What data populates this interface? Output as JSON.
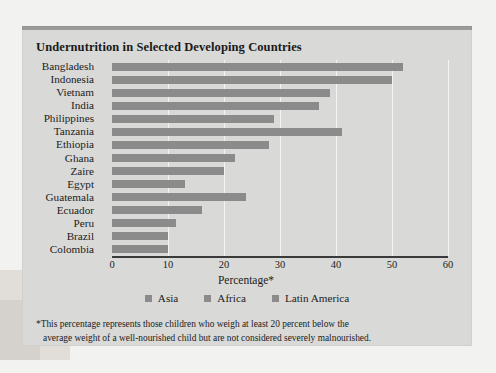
{
  "chart_data": {
    "type": "bar",
    "orientation": "horizontal",
    "title": "Undernutrition in Selected Developing Countries",
    "xlabel": "Percentage*",
    "ylabel": "",
    "xlim": [
      0,
      60
    ],
    "xticks": [
      0,
      10,
      20,
      30,
      40,
      50,
      60
    ],
    "xtick_labels": [
      "0",
      "10",
      "20",
      "30",
      "40",
      "50",
      "60"
    ],
    "grid": "vertical",
    "legend_position": "bottom-center",
    "categories": [
      "Bangladesh",
      "Indonesia",
      "Vietnam",
      "India",
      "Philippines",
      "Tanzania",
      "Ethiopia",
      "Ghana",
      "Zaire",
      "Egypt",
      "Guatemala",
      "Ecuador",
      "Peru",
      "Brazil",
      "Colombia"
    ],
    "values": [
      52,
      50,
      39,
      37,
      29,
      41,
      28,
      22,
      20,
      13,
      24,
      16,
      11.5,
      10,
      10
    ],
    "groups": [
      "Asia",
      "Asia",
      "Asia",
      "Asia",
      "Asia",
      "Africa",
      "Africa",
      "Africa",
      "Africa",
      "Africa",
      "Latin America",
      "Latin America",
      "Latin America",
      "Latin America",
      "Latin America"
    ],
    "legend": [
      "Asia",
      "Africa",
      "Latin America"
    ],
    "bar_color": "#8b8b8b",
    "panel_color": "#d9d9d7",
    "annotations": [
      "*This percentage represents those children who weigh at least 20 percent below the average weight of a well-nourished child but are not considered severely malnourished."
    ]
  },
  "footnote": {
    "line1": "*This percentage represents those children who weigh at least 20 percent below the",
    "line2": "average weight of a well-nourished child but are not considered severely malnourished."
  },
  "colors": {
    "bar": "#8b8b8b",
    "panel": "#d9d9d7",
    "page": "#f2f2f0",
    "text": "#1c1c1c",
    "gridline": "#f4f4f2",
    "axis": "#3a3a3a"
  }
}
